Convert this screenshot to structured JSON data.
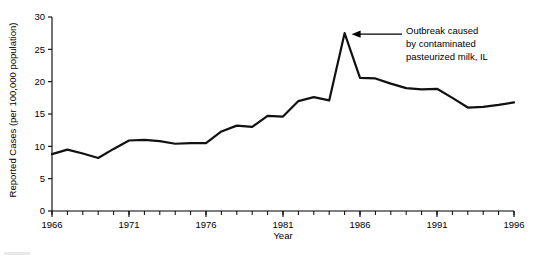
{
  "chart_data": {
    "type": "line",
    "title": "",
    "xlabel": "Year",
    "ylabel": "Reported Cases (per 100,000 population)",
    "xlim": [
      1966,
      1996
    ],
    "ylim": [
      0,
      30
    ],
    "ytick_step": 5,
    "xtick_step": 5,
    "xtick_minor_step": 1,
    "grid": false,
    "legend": null,
    "yticks": [
      "0",
      "5",
      "10",
      "15",
      "20",
      "25",
      "30"
    ],
    "ytick_values": [
      0,
      5,
      10,
      15,
      20,
      25,
      30
    ],
    "xticks": [
      "1966",
      "1971",
      "1976",
      "1981",
      "1986",
      "1991",
      "1996"
    ],
    "xtick_values": [
      1966,
      1971,
      1976,
      1981,
      1986,
      1991,
      1996
    ],
    "x": [
      1966,
      1967,
      1968,
      1969,
      1970,
      1971,
      1972,
      1973,
      1974,
      1975,
      1976,
      1977,
      1978,
      1979,
      1980,
      1981,
      1982,
      1983,
      1984,
      1985,
      1986,
      1987,
      1988,
      1989,
      1990,
      1991,
      1992,
      1993,
      1994,
      1995,
      1996
    ],
    "values": [
      8.8,
      9.5,
      8.9,
      8.2,
      9.6,
      10.9,
      11.0,
      10.8,
      10.4,
      10.5,
      10.5,
      12.3,
      13.2,
      13.0,
      14.7,
      14.6,
      17.0,
      17.6,
      17.1,
      27.5,
      20.6,
      20.5,
      19.7,
      19.0,
      18.8,
      18.9,
      17.5,
      16.0,
      16.1,
      16.4,
      16.8
    ],
    "annotations": [
      {
        "name": "outbreak-annotation",
        "lines": [
          "Outbreak caused",
          "by contaminated",
          "pasteurized milk, IL"
        ],
        "points_to_year": 1985,
        "points_to_value": 27.5,
        "arrow": "left"
      }
    ]
  },
  "figure": {
    "axis_color": "#000000",
    "series_color": "#111111",
    "background": "#ffffff"
  }
}
